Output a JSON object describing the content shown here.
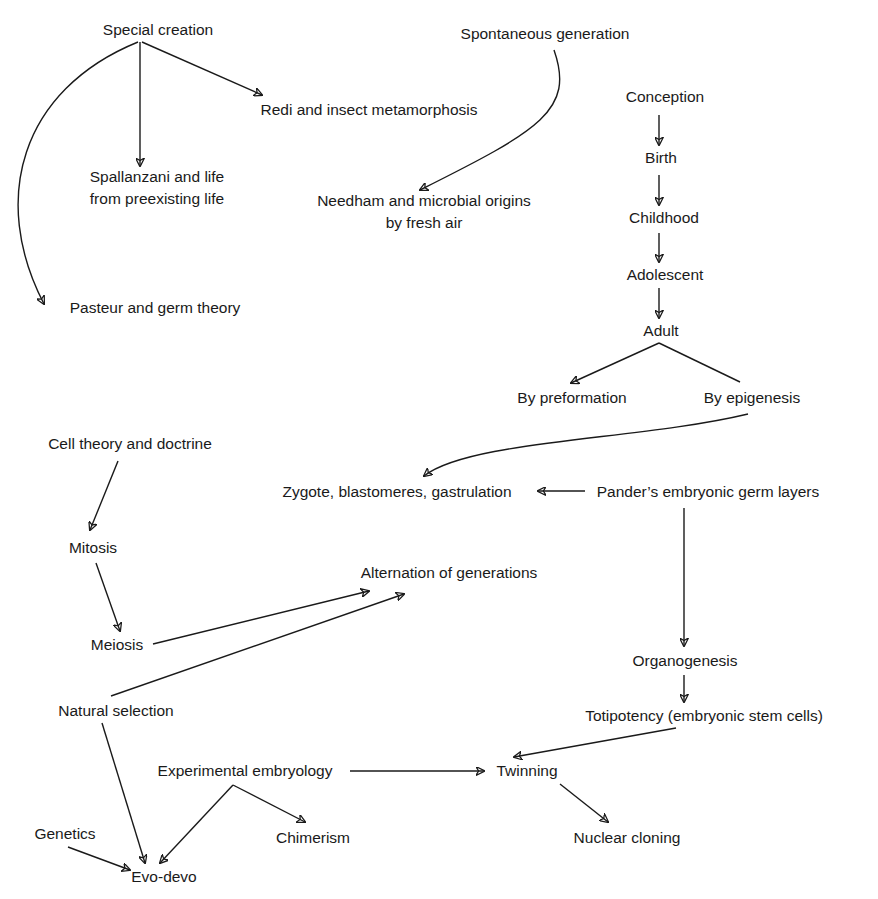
{
  "diagram": {
    "nodes": [
      {
        "id": "special_creation",
        "label": "Special creation",
        "x": 158,
        "y": 19,
        "align": "center"
      },
      {
        "id": "spontaneous_generation",
        "label": "Spontaneous generation",
        "x": 545,
        "y": 23,
        "align": "center"
      },
      {
        "id": "redi",
        "label": "Redi and insect metamorphosis",
        "x": 369,
        "y": 99,
        "align": "center"
      },
      {
        "id": "conception",
        "label": "Conception",
        "x": 665,
        "y": 86,
        "align": "center"
      },
      {
        "id": "spallanzani",
        "label": "Spallanzani and life\nfrom preexisting life",
        "x": 157,
        "y": 166,
        "align": "center"
      },
      {
        "id": "needham",
        "label": "Needham and microbial origins\nby fresh air",
        "x": 424,
        "y": 190,
        "align": "center"
      },
      {
        "id": "birth",
        "label": "Birth",
        "x": 661,
        "y": 147,
        "align": "center"
      },
      {
        "id": "childhood",
        "label": "Childhood",
        "x": 664,
        "y": 207,
        "align": "center"
      },
      {
        "id": "adolescent",
        "label": "Adolescent",
        "x": 665,
        "y": 264,
        "align": "center"
      },
      {
        "id": "pasteur",
        "label": "Pasteur and germ theory",
        "x": 155,
        "y": 297,
        "align": "center"
      },
      {
        "id": "adult",
        "label": "Adult",
        "x": 661,
        "y": 320,
        "align": "center"
      },
      {
        "id": "by_preformation",
        "label": "By preformation",
        "x": 572,
        "y": 387,
        "align": "center"
      },
      {
        "id": "by_epigenesis",
        "label": "By epigenesis",
        "x": 752,
        "y": 387,
        "align": "center"
      },
      {
        "id": "cell_theory",
        "label": "Cell theory and doctrine",
        "x": 130,
        "y": 433,
        "align": "center"
      },
      {
        "id": "zygote",
        "label": "Zygote, blastomeres, gastrulation",
        "x": 397,
        "y": 481,
        "align": "center"
      },
      {
        "id": "pander",
        "label": "Pander’s embryonic germ layers",
        "x": 708,
        "y": 481,
        "align": "center"
      },
      {
        "id": "mitosis",
        "label": "Mitosis",
        "x": 93,
        "y": 537,
        "align": "center"
      },
      {
        "id": "alternation",
        "label": "Alternation of generations",
        "x": 449,
        "y": 562,
        "align": "center"
      },
      {
        "id": "meiosis",
        "label": "Meiosis",
        "x": 117,
        "y": 634,
        "align": "center"
      },
      {
        "id": "organogenesis",
        "label": "Organogenesis",
        "x": 685,
        "y": 650,
        "align": "center"
      },
      {
        "id": "natural_selection",
        "label": "Natural selection",
        "x": 116,
        "y": 700,
        "align": "center"
      },
      {
        "id": "totipotency",
        "label": "Totipotency (embryonic stem cells)",
        "x": 704,
        "y": 705,
        "align": "center"
      },
      {
        "id": "experimental_embryology",
        "label": "Experimental embryology",
        "x": 245,
        "y": 760,
        "align": "center"
      },
      {
        "id": "twinning",
        "label": "Twinning",
        "x": 527,
        "y": 760,
        "align": "center"
      },
      {
        "id": "genetics",
        "label": "Genetics",
        "x": 65,
        "y": 823,
        "align": "center"
      },
      {
        "id": "chimerism",
        "label": "Chimerism",
        "x": 313,
        "y": 827,
        "align": "center"
      },
      {
        "id": "nuclear_cloning",
        "label": "Nuclear cloning",
        "x": 627,
        "y": 827,
        "align": "center"
      },
      {
        "id": "evo_devo",
        "label": "Evo-devo",
        "x": 164,
        "y": 866,
        "align": "center"
      }
    ],
    "edges": [
      {
        "from": "special_creation",
        "to": "spallanzani",
        "path": "M140 42 L140 166",
        "arrow": true
      },
      {
        "from": "special_creation",
        "to": "redi",
        "path": "M142 42 L262 95",
        "arrow": true
      },
      {
        "from": "special_creation",
        "to": "pasteur",
        "path": "M138 42 C 20 90, -10 200, 44 304",
        "arrow": true
      },
      {
        "from": "spontaneous_generation",
        "to": "needham",
        "path": "M554 50 C 575 110, 540 130, 420 190",
        "arrow": true
      },
      {
        "from": "conception",
        "to": "birth",
        "path": "M659 115 L659 145",
        "arrow": true
      },
      {
        "from": "birth",
        "to": "childhood",
        "path": "M659 175 L659 205",
        "arrow": true
      },
      {
        "from": "childhood",
        "to": "adolescent",
        "path": "M659 233 L659 262",
        "arrow": true
      },
      {
        "from": "adolescent",
        "to": "adult",
        "path": "M659 288 L659 318",
        "arrow": true
      },
      {
        "from": "adult",
        "to": "by_preformation",
        "path": "M659 343 L571 383",
        "arrow": true
      },
      {
        "from": "adult",
        "to": "by_epigenesis",
        "path": "M659 343 L740 382",
        "arrow": false
      },
      {
        "from": "by_epigenesis",
        "to": "zygote",
        "path": "M748 414 C 640 440, 470 440, 424 476",
        "arrow": true
      },
      {
        "from": "pander",
        "to": "zygote",
        "path": "M585 491 L538 491",
        "arrow": true
      },
      {
        "from": "pander",
        "to": "organogenesis",
        "path": "M684 508 L684 646",
        "arrow": true
      },
      {
        "from": "organogenesis",
        "to": "totipotency",
        "path": "M684 675 L684 702",
        "arrow": true
      },
      {
        "from": "totipotency",
        "to": "twinning",
        "path": "M676 728 L514 757",
        "arrow": true
      },
      {
        "from": "cell_theory",
        "to": "mitosis",
        "path": "M118 461 L90 530",
        "arrow": true
      },
      {
        "from": "mitosis",
        "to": "meiosis",
        "path": "M96 563 L120 631",
        "arrow": true
      },
      {
        "from": "meiosis",
        "to": "alternation",
        "path": "M153 644 L369 591",
        "arrow": true
      },
      {
        "from": "natural_selection",
        "to": "alternation",
        "path": "M111 696 L404 594",
        "arrow": true
      },
      {
        "from": "natural_selection",
        "to": "evo_devo",
        "path": "M102 723 L145 863",
        "arrow": true
      },
      {
        "from": "experimental_embryology",
        "to": "twinning",
        "path": "M350 771 L484 771",
        "arrow": true
      },
      {
        "from": "experimental_embryology",
        "to": "evo_devo",
        "path": "M233 785 L160 863",
        "arrow": true
      },
      {
        "from": "experimental_embryology",
        "to": "chimerism",
        "path": "M233 785 L305 822",
        "arrow": true
      },
      {
        "from": "genetics",
        "to": "evo_devo",
        "path": "M68 847 L130 870",
        "arrow": true
      },
      {
        "from": "twinning",
        "to": "nuclear_cloning",
        "path": "M560 784 L608 822",
        "arrow": true
      }
    ]
  }
}
